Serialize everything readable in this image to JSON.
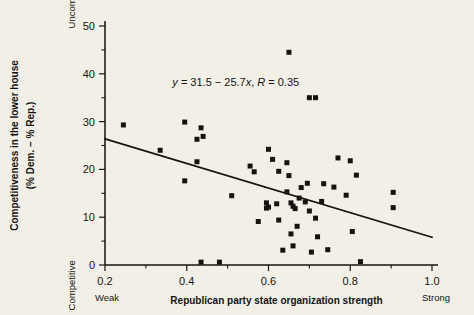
{
  "figure": {
    "background_color": "#f2efe6",
    "ink_color": "#16120f"
  },
  "chart_data": {
    "type": "scatter",
    "title": "",
    "xlabel": "Republican party state organization strength",
    "ylabel": "Competitiveness in the lower house (% Dem. − % Rep.)",
    "ylabel_line1": "Competitiveness in the lower house",
    "ylabel_line2": "(% Dem. − % Rep.)",
    "xlim": [
      0.16,
      1.02
    ],
    "ylim": [
      0,
      52
    ],
    "xticks": [
      0.2,
      0.4,
      0.6,
      0.8,
      1.0
    ],
    "xtick_labels": [
      "0.2",
      "0.4",
      "0.6",
      "0.8",
      "1.0"
    ],
    "yticks": [
      0,
      10,
      20,
      30,
      40,
      50
    ],
    "ytick_labels": [
      "0",
      "10",
      "20",
      "30",
      "40",
      "50"
    ],
    "x_minor_ticks": [
      0.3,
      0.5,
      0.7,
      0.9
    ],
    "y_minor_ticks": [
      5,
      15,
      25,
      35,
      45
    ],
    "grid": false,
    "legend": false,
    "x_axis_end_labels": {
      "left": "Weak",
      "right": "Strong"
    },
    "y_axis_end_labels": {
      "top": "Uncompetitive",
      "bottom": "Competitive"
    },
    "annotation": {
      "text": "y = 31.5 − 25.7x, R = 0.35",
      "slope": -25.7,
      "intercept": 31.5,
      "r": 0.35,
      "x": 0.52,
      "y": 37.5
    },
    "fit_line": {
      "x": [
        0.2,
        1.0
      ],
      "y": [
        26.4,
        5.8
      ]
    },
    "marker": {
      "shape": "square",
      "size_px": 5,
      "color": "#16120f"
    },
    "points": [
      [
        0.245,
        29.3
      ],
      [
        0.335,
        24.0
      ],
      [
        0.395,
        29.9
      ],
      [
        0.395,
        17.6
      ],
      [
        0.425,
        26.3
      ],
      [
        0.435,
        28.7
      ],
      [
        0.44,
        26.9
      ],
      [
        0.425,
        21.6
      ],
      [
        0.435,
        0.6
      ],
      [
        0.51,
        14.5
      ],
      [
        0.555,
        20.7
      ],
      [
        0.565,
        19.5
      ],
      [
        0.595,
        13.0
      ],
      [
        0.595,
        11.9
      ],
      [
        0.575,
        9.1
      ],
      [
        0.6,
        24.2
      ],
      [
        0.61,
        22.1
      ],
      [
        0.625,
        19.6
      ],
      [
        0.645,
        21.4
      ],
      [
        0.625,
        9.4
      ],
      [
        0.635,
        3.1
      ],
      [
        0.65,
        44.5
      ],
      [
        0.65,
        18.7
      ],
      [
        0.645,
        15.3
      ],
      [
        0.655,
        13.0
      ],
      [
        0.66,
        12.3
      ],
      [
        0.665,
        11.8
      ],
      [
        0.655,
        6.5
      ],
      [
        0.66,
        4.0
      ],
      [
        0.68,
        16.2
      ],
      [
        0.675,
        14.0
      ],
      [
        0.67,
        8.1
      ],
      [
        0.69,
        13.2
      ],
      [
        0.7,
        35.0
      ],
      [
        0.715,
        35.0
      ],
      [
        0.695,
        17.1
      ],
      [
        0.7,
        11.3
      ],
      [
        0.705,
        2.7
      ],
      [
        0.715,
        9.8
      ],
      [
        0.72,
        5.9
      ],
      [
        0.73,
        13.3
      ],
      [
        0.735,
        17.0
      ],
      [
        0.745,
        3.2
      ],
      [
        0.76,
        16.3
      ],
      [
        0.77,
        22.4
      ],
      [
        0.79,
        14.6
      ],
      [
        0.8,
        21.8
      ],
      [
        0.805,
        7.0
      ],
      [
        0.815,
        18.8
      ],
      [
        0.825,
        0.7
      ],
      [
        0.905,
        15.2
      ],
      [
        0.905,
        12.0
      ],
      [
        0.6,
        12.1
      ],
      [
        0.62,
        12.8
      ],
      [
        0.48,
        0.6
      ]
    ]
  }
}
